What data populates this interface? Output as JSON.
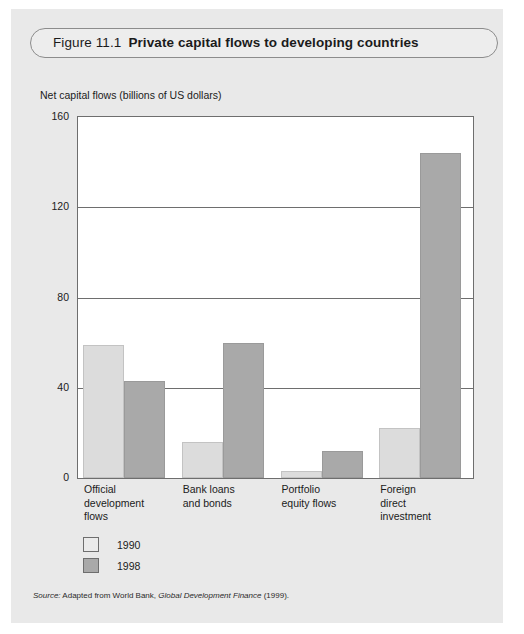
{
  "figure": {
    "number": "Figure 11.1",
    "title": "Private capital flows to developing countries"
  },
  "axis_title": "Net capital flows (billions of US dollars)",
  "source": {
    "prefix": "Source:",
    "body": "Adapted from World Bank,",
    "publication": "Global Development Finance",
    "year": "(1999)."
  },
  "legend": {
    "items": [
      {
        "label": "1990",
        "color": "#ebebeb"
      },
      {
        "label": "1998",
        "color": "#a9a9a9"
      }
    ]
  },
  "colors": {
    "series_1990": "#dcdcdc",
    "series_1998": "#a9a9a9",
    "frame": "#6e6e6e",
    "page_background": "#e9e9e9",
    "plot_background": "#ffffff"
  },
  "chart_data": {
    "type": "bar",
    "title": "Private capital flows to developing countries",
    "xlabel": "",
    "ylabel": "Net capital flows (billions of US dollars)",
    "ylim": [
      0,
      160
    ],
    "yticks": [
      0,
      40,
      80,
      120,
      160
    ],
    "ytick_labels": [
      "0",
      "40",
      "80",
      "120",
      "160"
    ],
    "grid": true,
    "legend_position": "below-left",
    "categories": [
      "Official\ndevelopment\nflows",
      "Bank loans\nand bonds",
      "Portfolio\nequity flows",
      "Foreign\ndirect\ninvestment"
    ],
    "series": [
      {
        "name": "1990",
        "values": [
          59,
          16,
          3,
          22
        ]
      },
      {
        "name": "1998",
        "values": [
          43,
          60,
          12,
          144
        ]
      }
    ]
  }
}
